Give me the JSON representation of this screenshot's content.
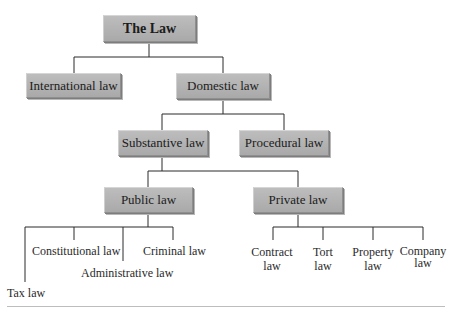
{
  "diagram": {
    "type": "hierarchy-tree",
    "root": "The Law",
    "level1": {
      "international": "International law",
      "domestic": "Domestic law"
    },
    "level2": {
      "substantive": "Substantive law",
      "procedural": "Procedural law"
    },
    "level3": {
      "public": "Public law",
      "private": "Private law"
    },
    "public_children": {
      "tax": "Tax law",
      "constitutional": "Constitutional law",
      "administrative": "Administrative law",
      "criminal": "Criminal law"
    },
    "private_children": {
      "contract_1": "Contract",
      "contract_2": "law",
      "tort_1": "Tort",
      "tort_2": "law",
      "property_1": "Property",
      "property_2": "law",
      "company_1": "Company",
      "company_2": "law"
    },
    "colors": {
      "box_fill": "#b3b3b3",
      "box_border": "#8f8f8f",
      "line": "#222222",
      "rule": "#bdbdbd"
    }
  }
}
